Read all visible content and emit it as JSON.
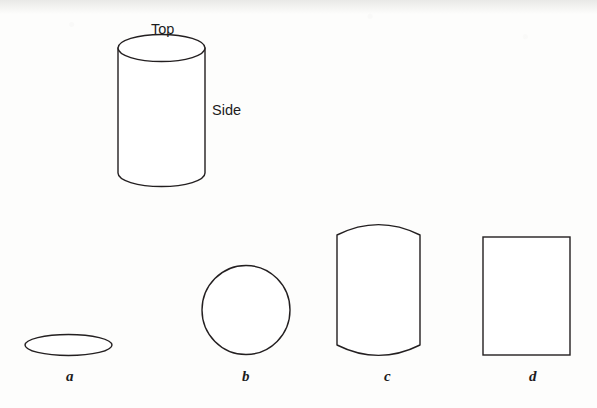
{
  "figure": {
    "background_color": "#fdfdfc",
    "stroke_color": "#231f20",
    "fill_color": "#ffffff",
    "stroke_width": 1.4
  },
  "callouts": [
    {
      "key": "top",
      "text": "Top",
      "x": 151,
      "y": 21
    },
    {
      "key": "side",
      "text": "Side",
      "x": 212,
      "y": 102
    }
  ],
  "cylinder": {
    "name": "3d-cylinder",
    "left": 118,
    "right": 205,
    "top_ellipse_cy": 48,
    "bottom_ellipse_cy": 173,
    "ellipse_rx": 43.5,
    "ellipse_ry": 13.5
  },
  "shapes": [
    {
      "key": "a",
      "name": "flat-ellipse-shape",
      "type": "ellipse",
      "label": "a",
      "label_x": 66,
      "label_y": 368,
      "cx": 68.5,
      "cy": 345,
      "rx": 43.5,
      "ry": 10.5
    },
    {
      "key": "b",
      "name": "circle-shape",
      "type": "ellipse",
      "label": "b",
      "label_x": 242,
      "label_y": 368,
      "cx": 246,
      "cy": 310,
      "rx": 44,
      "ry": 44.5
    },
    {
      "key": "c",
      "name": "curved-edge-rectangle-shape",
      "type": "curved-rect",
      "label": "c",
      "label_x": 384,
      "label_y": 368,
      "left": 337,
      "right": 420,
      "top": 235,
      "bottom": 345,
      "arc_depth": 13
    },
    {
      "key": "d",
      "name": "plain-rectangle-shape",
      "type": "rect",
      "label": "d",
      "label_x": 529,
      "label_y": 368,
      "left": 483,
      "right": 570,
      "top": 237,
      "bottom": 355
    }
  ],
  "chart_data": {
    "type": "diagram",
    "annotations": [
      "Top",
      "Side"
    ],
    "options": [
      {
        "label": "a",
        "shape": "flat ellipse"
      },
      {
        "label": "b",
        "shape": "circle"
      },
      {
        "label": "c",
        "shape": "rectangle with curved top and bottom edges"
      },
      {
        "label": "d",
        "shape": "plain rectangle"
      }
    ]
  }
}
